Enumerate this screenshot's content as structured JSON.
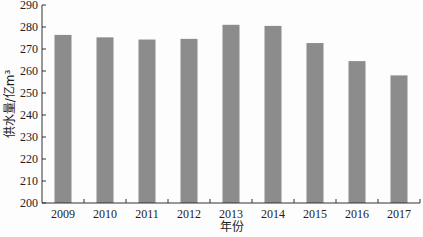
{
  "chart_data": {
    "type": "bar",
    "title": "",
    "xlabel": "年份",
    "ylabel": "供水量/亿m³",
    "categories": [
      "2009",
      "2010",
      "2011",
      "2012",
      "2013",
      "2014",
      "2015",
      "2016",
      "2017"
    ],
    "values": [
      276.4,
      275.3,
      274.3,
      274.6,
      281.0,
      280.5,
      272.7,
      264.5,
      258.0
    ],
    "ylim": [
      200,
      290
    ],
    "yticks": [
      200,
      210,
      220,
      230,
      240,
      250,
      260,
      270,
      280,
      290
    ],
    "grid": false,
    "legend": null,
    "bar_color": "#8c8c8c"
  }
}
